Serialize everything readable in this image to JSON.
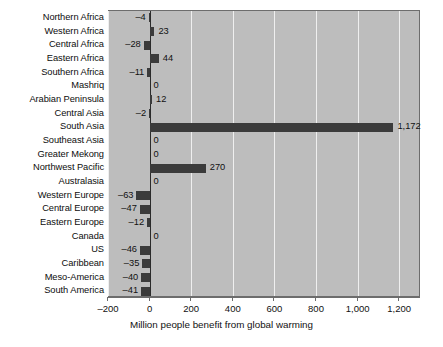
{
  "chart_data": {
    "type": "bar",
    "orientation": "horizontal",
    "title": "",
    "xlabel": "Million people benefit from global warming",
    "ylabel": "",
    "xlim": [
      -200,
      1300
    ],
    "xticks": [
      -200,
      0,
      200,
      400,
      600,
      800,
      1000,
      1200
    ],
    "xtick_labels": [
      "–200",
      "0",
      "200",
      "400",
      "600",
      "800",
      "1,000",
      "1,200"
    ],
    "grid": "vertical",
    "legend": "none",
    "plot_background_color": "#bdbdbd",
    "bar_color": "#3b3b3b",
    "gridline_color": "#efefef",
    "categories": [
      "Northern Africa",
      "Western Africa",
      "Central Africa",
      "Eastern Africa",
      "Southern Africa",
      "Mashriq",
      "Arabian Peninsula",
      "Central Asia",
      "South Asia",
      "Southeast Asia",
      "Greater Mekong",
      "Northwest Pacific",
      "Australasia",
      "Western Europe",
      "Central Europe",
      "Eastern Europe",
      "Canada",
      "US",
      "Caribbean",
      "Meso-America",
      "South America"
    ],
    "values": [
      -4,
      23,
      -28,
      44,
      -11,
      0,
      12,
      -2,
      1172,
      0,
      0,
      270,
      0,
      -63,
      -47,
      -12,
      0,
      -46,
      -35,
      -40,
      -41
    ],
    "value_labels": [
      "–4",
      "23",
      "–28",
      "44",
      "–11",
      "0",
      "12",
      "–2",
      "1,172",
      "0",
      "0",
      "270",
      "0",
      "–63",
      "–47",
      "–12",
      "0",
      "–46",
      "–35",
      "–40",
      "–41"
    ]
  }
}
